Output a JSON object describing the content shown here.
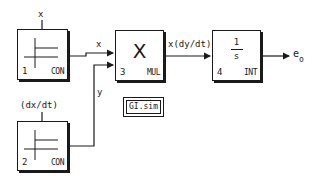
{
  "diagram": {
    "title": "GI.sim",
    "file_label": "GI.sim",
    "blocks": [
      {
        "id": 1,
        "number": "1",
        "type": "CON",
        "symbol": "step-plot",
        "top_label": "x"
      },
      {
        "id": 2,
        "number": "2",
        "type": "CON",
        "symbol": "step-plot",
        "top_label": "(dx/dt)"
      },
      {
        "id": 3,
        "number": "3",
        "type": "MUL",
        "symbol": "X"
      },
      {
        "id": 4,
        "number": "4",
        "type": "INT",
        "symbol_numerator": "1",
        "symbol_denominator": "s"
      }
    ],
    "signals": {
      "con1_to_mul": "x",
      "con2_to_mul": "y",
      "mul_to_int": "x(dy/dt)",
      "output_base": "e",
      "output_sub": "o"
    },
    "colors": {
      "line": "#1a1a1a",
      "background": "#ffffff"
    }
  }
}
